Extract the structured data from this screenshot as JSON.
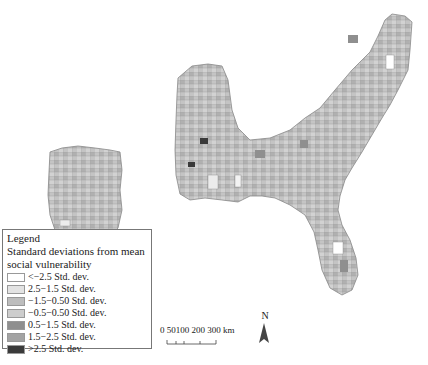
{
  "legend": {
    "title": "Legend",
    "subtitle_line1": "Standard deviations from mean",
    "subtitle_line2": "social vulnerability",
    "items": [
      {
        "label": "<−2.5 Std. dev.",
        "color": "#ffffff"
      },
      {
        "label": "2.5−1.5 Std. dev.",
        "color": "#e3e3e3"
      },
      {
        "label": "−1.5−0.50 Std. dev.",
        "color": "#bdbdbd"
      },
      {
        "label": "−0.5−0.50 Std. dev.",
        "color": "#cdcdcd"
      },
      {
        "label": "0.5−1.5 Std. dev.",
        "color": "#8f8f8f"
      },
      {
        "label": "1.5−2.5 Std. dev.",
        "color": "#a3a3a3"
      },
      {
        "label": ">2.5 Std. dev.",
        "color": "#3a3a3a"
      }
    ]
  },
  "scale_bar": {
    "label": "0  50100 200  300 km"
  },
  "north_arrow": {
    "label": "N"
  }
}
